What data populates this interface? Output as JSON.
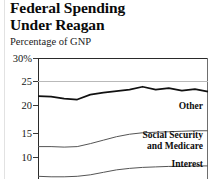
{
  "chart_data": {
    "type": "area",
    "title": "Federal Spending Under Reagan",
    "title_line1": "Federal Spending",
    "title_line2": "Under Reagan",
    "subtitle": "Percentage of GNP",
    "ylabel": "Percentage of GNP",
    "xlabel": "",
    "ylim": [
      5,
      30
    ],
    "grid": true,
    "legend_position": "inline-right",
    "ytick_labels": [
      "30%",
      "25",
      "20",
      "15",
      "10"
    ],
    "ytick_values": [
      30,
      25,
      20,
      15,
      10
    ],
    "stacked": true,
    "series": [
      {
        "name": "Other",
        "label": "Other",
        "description": "Total federal spending boundary (top line)",
        "values": [
          22.3,
          22.2,
          21.8,
          21.6,
          22.6,
          23.0,
          23.3,
          23.6,
          24.2,
          23.6,
          23.9,
          23.4,
          23.7,
          23.2
        ]
      },
      {
        "name": "Social Security and Medicare",
        "label": "Social Security and Medicare",
        "label_line1": "Social Security",
        "label_line2": "and Medicare",
        "values": [
          12.1,
          12.1,
          12.0,
          12.1,
          12.7,
          13.4,
          14.1,
          14.6,
          14.9,
          15.0,
          15.1,
          15.2,
          15.3,
          15.3
        ]
      },
      {
        "name": "Interest",
        "label": "Interest",
        "values": [
          6.1,
          6.0,
          6.0,
          6.1,
          6.4,
          6.9,
          7.4,
          7.7,
          7.9,
          8.0,
          8.1,
          8.1,
          8.2,
          8.2
        ]
      }
    ]
  },
  "colors": {
    "line": "#111111",
    "gridline": "#b9b9b9",
    "axis": "#2a2a2a",
    "background": "#ffffff",
    "text": "#111111"
  }
}
